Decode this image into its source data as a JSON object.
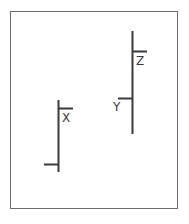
{
  "diagram": {
    "background_color": "#ffffff",
    "stroke_color": "#3a3a3a",
    "frame": {
      "name": "outer-border",
      "color": "#6e6e6e",
      "x": 10,
      "y": 11,
      "width": 168,
      "height": 198,
      "stroke_width": 1
    },
    "labels": [
      {
        "id": "x",
        "text": "X",
        "x": 62,
        "y": 112,
        "color": "#3a3a3a"
      },
      {
        "id": "y",
        "text": "Y",
        "x": 113,
        "y": 101,
        "color": "#3a3a3a"
      },
      {
        "id": "z",
        "text": "Z",
        "x": 136,
        "y": 55,
        "color": "#3a3a3a"
      }
    ],
    "shapes": [
      {
        "id": "shape-x",
        "name": "left-vertical-with-ticks",
        "label": "X",
        "vertical": {
          "x": 58.5,
          "y1": 100,
          "y2": 172
        },
        "ticks": [
          {
            "id": "x-upper-tick",
            "direction": "right",
            "y": 108.5,
            "x1": 58.5,
            "x2": 73
          },
          {
            "id": "x-lower-tick",
            "direction": "left",
            "y": 164.5,
            "x1": 44,
            "x2": 58.5
          }
        ]
      },
      {
        "id": "shape-yz",
        "name": "right-vertical-with-ticks",
        "label": "Y / Z",
        "vertical": {
          "x": 132.5,
          "y1": 31,
          "y2": 134
        },
        "ticks": [
          {
            "id": "z-tick",
            "direction": "right",
            "y": 51.5,
            "x1": 132.5,
            "x2": 147
          },
          {
            "id": "y-tick",
            "direction": "left",
            "y": 98.5,
            "x1": 118,
            "x2": 132.5
          }
        ]
      }
    ],
    "stroke_width": 2
  }
}
